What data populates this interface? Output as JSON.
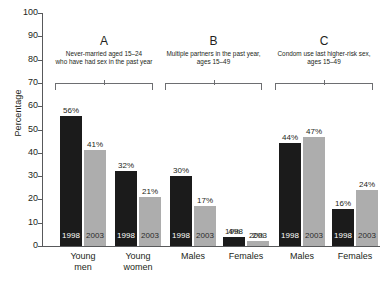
{
  "chart_data": {
    "type": "bar",
    "title": "",
    "xlabel": "",
    "ylabel": "Percentage",
    "ylim": [
      0,
      100
    ],
    "ytick_labels": [
      "100",
      "90",
      "80",
      "70",
      "60",
      "50",
      "40",
      "30",
      "20",
      "10",
      "0"
    ],
    "ytick_values": [
      100,
      90,
      80,
      70,
      60,
      50,
      40,
      30,
      20,
      10,
      0
    ],
    "grid": false,
    "legend_position": "none",
    "categories": [
      "Young\nmen",
      "Young\nwomen",
      "Males",
      "Females",
      "Males",
      "Females"
    ],
    "series": [
      {
        "name": "1998",
        "color": "#1b1b1b",
        "values": [
          56,
          32,
          30,
          4,
          44,
          16
        ]
      },
      {
        "name": "2003",
        "color": "#adadad",
        "values": [
          41,
          21,
          17,
          2,
          47,
          24
        ]
      }
    ],
    "panels": [
      {
        "letter": "A",
        "caption": "Never-married aged 15–24\nwho have had sex in the past year",
        "categories": [
          "Young\nmen",
          "Young\nwomen"
        ]
      },
      {
        "letter": "B",
        "caption": "Multiple partners in the past year,\nages 15–49",
        "categories": [
          "Males",
          "Females"
        ]
      },
      {
        "letter": "C",
        "caption": "Condom use last higher-risk sex,\nages 15–49",
        "categories": [
          "Males",
          "Females"
        ]
      }
    ],
    "bars": [
      {
        "panel": "A",
        "category": "Young men",
        "year": "1998",
        "value": 56,
        "label": "56%",
        "color": "dark",
        "year_label_position": "inside"
      },
      {
        "panel": "A",
        "category": "Young men",
        "year": "2003",
        "value": 41,
        "label": "41%",
        "color": "light",
        "year_label_position": "inside"
      },
      {
        "panel": "A",
        "category": "Young women",
        "year": "1998",
        "value": 32,
        "label": "32%",
        "color": "dark",
        "year_label_position": "inside"
      },
      {
        "panel": "A",
        "category": "Young women",
        "year": "2003",
        "value": 21,
        "label": "21%",
        "color": "light",
        "year_label_position": "inside"
      },
      {
        "panel": "B",
        "category": "Males",
        "year": "1998",
        "value": 30,
        "label": "30%",
        "color": "dark",
        "year_label_position": "inside"
      },
      {
        "panel": "B",
        "category": "Males",
        "year": "2003",
        "value": 17,
        "label": "17%",
        "color": "light",
        "year_label_position": "inside"
      },
      {
        "panel": "B",
        "category": "Females",
        "year": "1998",
        "value": 4,
        "label": "4%",
        "color": "dark",
        "year_label_position": "outside"
      },
      {
        "panel": "B",
        "category": "Females",
        "year": "2003",
        "value": 2,
        "label": "2%",
        "color": "light",
        "year_label_position": "outside"
      },
      {
        "panel": "C",
        "category": "Males",
        "year": "1998",
        "value": 44,
        "label": "44%",
        "color": "dark",
        "year_label_position": "inside"
      },
      {
        "panel": "C",
        "category": "Males",
        "year": "2003",
        "value": 47,
        "label": "47%",
        "color": "light",
        "year_label_position": "inside"
      },
      {
        "panel": "C",
        "category": "Females",
        "year": "1998",
        "value": 16,
        "label": "16%",
        "color": "dark",
        "year_label_position": "inside"
      },
      {
        "panel": "C",
        "category": "Females",
        "year": "2003",
        "value": 24,
        "label": "24%",
        "color": "light",
        "year_label_position": "inside"
      }
    ]
  },
  "axis": {
    "y_title": "Percentage",
    "ticks": [
      "100",
      "90",
      "80",
      "70",
      "60",
      "50",
      "40",
      "30",
      "20",
      "10",
      "0"
    ]
  },
  "panels": {
    "a": {
      "letter": "A",
      "caption": "Never-married aged 15–24\nwho have had sex in the past year"
    },
    "b": {
      "letter": "B",
      "caption": "Multiple partners in the past year,\nages 15–49"
    },
    "c": {
      "letter": "C",
      "caption": "Condom use last higher-risk sex,\nages 15–49"
    }
  },
  "x_labels": [
    "Young\nmen",
    "Young\nwomen",
    "Males",
    "Females",
    "Males",
    "Females"
  ],
  "bar_values": [
    "56%",
    "41%",
    "32%",
    "21%",
    "30%",
    "17%",
    "4%",
    "2%",
    "44%",
    "47%",
    "16%",
    "24%"
  ],
  "bar_years": [
    "1998",
    "2003",
    "1998",
    "2003",
    "1998",
    "2003",
    "1998",
    "2003",
    "1998",
    "2003",
    "1998",
    "2003"
  ],
  "colors": {
    "series_1998": "#1b1b1b",
    "series_2003": "#adadad",
    "axis": "#58595b",
    "text": "#231f20",
    "background": "#ffffff"
  }
}
